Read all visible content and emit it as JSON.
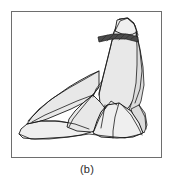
{
  "figure": {
    "caption": "(b)",
    "panel_label": "b",
    "colors": {
      "background": "#ffffff",
      "frame_border": "#6e6e6e",
      "rock_fill": "#e8e8e8",
      "rock_fill_light": "#efefef",
      "rock_fill_shadow": "#dcdcdc",
      "outline": "#1a1a1a",
      "hatch_band": "#4a4a4a",
      "caption_text": "#2b2b2b"
    },
    "frame": {
      "x": 11,
      "y": 11,
      "width": 151,
      "height": 147
    },
    "shapes": [
      {
        "name": "main-peak",
        "description": "tall pointed rock spire forming the summit and right face",
        "fill": "#e8e8e8",
        "points": "118,18 127,17 133,22 135,30 137,42 140,56 141,70 139,84 134,96 128,106 121,112 112,114 104,110 99,102 98,92 101,80 104,68 107,56 110,44 113,31"
      },
      {
        "name": "summit-cap",
        "description": "small rounded cap at the very top of the spire above the dark band",
        "fill": "#efefef",
        "points": "116,19 126,17 133,23 136,31 130,34 121,33 114,30"
      },
      {
        "name": "hatch-band",
        "description": "dark hatched stratum band crossing just below the summit",
        "fill": "#4a4a4a",
        "points": "97,36 112,33 126,33 137,36 137,41 125,38 111,38 98,41"
      },
      {
        "name": "right-flank",
        "description": "right-hand sloping face descending from the spire to the base",
        "fill": "#dcdcdc",
        "points": "135,30 139,48 142,66 143,84 140,100 135,112 129,120 124,126 127,112 132,98 135,82 136,64 136,46"
      },
      {
        "name": "left-shoulder",
        "description": "broad left shoulder slab sloping down from mid-spire",
        "fill": "#e8e8e8",
        "points": "98,70 89,74 78,80 68,86 58,93 48,100 39,108 31,116 26,123 34,122 46,118 58,113 70,108 82,102 92,94 98,86"
      },
      {
        "name": "lower-left-slab",
        "description": "long flat slab extending to the left base tip",
        "fill": "#efefef",
        "points": "26,123 20,128 18,133 22,137 34,138 50,137 66,136 80,134 90,131 84,126 70,122 54,120 40,120"
      },
      {
        "name": "center-wedge",
        "description": "wedge block between the left slab and the spire foot",
        "fill": "#e8e8e8",
        "points": "92,94 82,102 74,110 68,118 66,126 76,130 90,131 100,128 106,120 106,110 100,102"
      },
      {
        "name": "foreground-boulder",
        "description": "triangular boulder in front of the spire foot",
        "fill": "#efefef",
        "points": "106,104 118,102 130,110 138,122 142,132 132,136 116,137 100,136 92,132 96,120 100,111"
      },
      {
        "name": "right-base-block",
        "description": "small block at the right base behind the boulder",
        "fill": "#dcdcdc",
        "points": "130,108 138,104 144,112 146,124 143,132 137,126 133,118"
      }
    ],
    "creases": [
      {
        "name": "crease-spire-left-ridge",
        "path": "M113,31 L107,56 L101,80 L98,94"
      },
      {
        "name": "crease-spire-right-ridge",
        "path": "M135,30 L139,50 L141,70 L139,88 L134,102"
      },
      {
        "name": "crease-summit-outline",
        "path": "M114,30 L119,20 L127,17 L134,24 L137,34"
      },
      {
        "name": "crease-shoulder-break",
        "path": "M98,70 L84,78 L68,87 L52,97 L38,108 L27,120"
      },
      {
        "name": "crease-shoulder-lower",
        "path": "M92,94 L76,100 L60,107 L44,114 L31,121"
      },
      {
        "name": "crease-slab-edge",
        "path": "M26,123 L40,120 L58,120 L74,123 L88,128"
      },
      {
        "name": "crease-base-bottom",
        "path": "M18,133 L30,138 L48,138 L68,136 L88,133 L104,135 L124,137 L140,133"
      },
      {
        "name": "crease-wedge-left",
        "path": "M98,86 L90,96 L80,108 L72,118 L68,126"
      },
      {
        "name": "crease-wedge-right",
        "path": "M104,104 L102,116 L100,127"
      },
      {
        "name": "crease-boulder-ridge",
        "path": "M118,102 L114,116 L112,130 L112,137"
      },
      {
        "name": "crease-boulder-left",
        "path": "M106,104 L98,118 L93,130"
      },
      {
        "name": "crease-boulder-right",
        "path": "M120,103 L130,114 L137,126 L141,134"
      },
      {
        "name": "crease-right-block",
        "path": "M138,104 L144,116 L145,128"
      },
      {
        "name": "crease-spire-notch",
        "path": "M104,108 L110,100 L116,104"
      },
      {
        "name": "crease-mid-fold",
        "path": "M101,80 L95,88 L92,96"
      }
    ],
    "hatch_lines": [
      {
        "name": "hatch-1",
        "path": "M100,40 L106,34"
      },
      {
        "name": "hatch-2",
        "path": "M106,40 L112,34"
      },
      {
        "name": "hatch-3",
        "path": "M112,39 L118,33"
      },
      {
        "name": "hatch-4",
        "path": "M118,39 L124,33"
      },
      {
        "name": "hatch-5",
        "path": "M124,38 L130,33"
      },
      {
        "name": "hatch-6",
        "path": "M130,38 L135,34"
      }
    ]
  }
}
